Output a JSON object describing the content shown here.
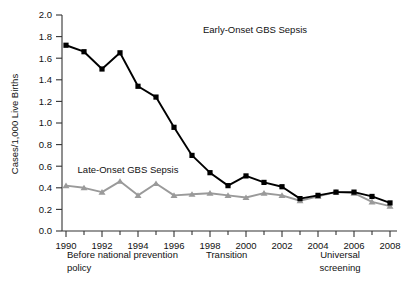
{
  "chart_data": {
    "type": "line",
    "title": "",
    "xlabel": "",
    "ylabel": "Cases/1,000 Live Births",
    "xlim": [
      1990,
      2008
    ],
    "ylim": [
      0.0,
      2.0
    ],
    "grid": false,
    "legend_position": "inline-annotations",
    "x": [
      1990,
      1991,
      1992,
      1993,
      1994,
      1995,
      1996,
      1997,
      1998,
      1999,
      2000,
      2001,
      2002,
      2003,
      2004,
      2005,
      2006,
      2007,
      2008
    ],
    "xticks": [
      "1990",
      "1992",
      "1994",
      "1996",
      "1998",
      "2000",
      "2002",
      "2004",
      "2006",
      "2008"
    ],
    "yticks": [
      "0.0",
      "0.2",
      "0.4",
      "0.6",
      "0.8",
      "1.0",
      "1.2",
      "1.4",
      "1.6",
      "1.8",
      "2.0"
    ],
    "series": [
      {
        "name": "Early-Onset GBS Sepsis",
        "color": "#000000",
        "marker": "square",
        "values": [
          1.72,
          1.66,
          1.5,
          1.65,
          1.34,
          1.24,
          0.96,
          0.7,
          0.54,
          0.42,
          0.51,
          0.45,
          0.41,
          0.3,
          0.33,
          0.36,
          0.36,
          0.32,
          0.26
        ]
      },
      {
        "name": "Late-Onset GBS Sepsis",
        "color": "#9a9a9a",
        "marker": "triangle",
        "values": [
          0.42,
          0.4,
          0.36,
          0.46,
          0.33,
          0.44,
          0.33,
          0.34,
          0.35,
          0.33,
          0.31,
          0.35,
          0.33,
          0.28,
          0.32,
          0.36,
          0.35,
          0.27,
          0.23
        ]
      }
    ],
    "annotations": [
      {
        "name": "early-onset-label",
        "text": "Early-Onset GBS Sepsis"
      },
      {
        "name": "late-onset-label",
        "text": "Late-Onset GBS Sepsis"
      }
    ],
    "period_labels": [
      {
        "name": "period-before-policy",
        "line1": "Before national prevention",
        "line2": "policy"
      },
      {
        "name": "period-transition",
        "line1": "Transition",
        "line2": ""
      },
      {
        "name": "period-universal-screening",
        "line1": "Universal",
        "line2": "screening"
      }
    ]
  }
}
